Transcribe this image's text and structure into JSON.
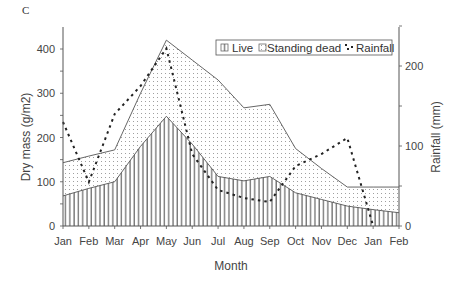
{
  "panel_label": "C",
  "chart_data": {
    "type": "area",
    "title": "",
    "xlabel": "Month",
    "ylabel": "Dry mass (g/m2)",
    "y2label": "Rainfall (mm)",
    "categories": [
      "Jan",
      "Feb",
      "Mar",
      "Apr",
      "May",
      "Jun",
      "Jul",
      "Aug",
      "Sep",
      "Oct",
      "Nov",
      "Dec",
      "Jan",
      "Feb"
    ],
    "ylim": [
      0,
      450
    ],
    "y2lim": [
      0,
      250
    ],
    "yticks": [
      0,
      100,
      200,
      300,
      400
    ],
    "y2ticks": [
      0,
      100,
      200
    ],
    "grid": false,
    "legend_position": "top-right",
    "series": [
      {
        "name": "Live",
        "type": "area",
        "pattern": "vertical-lines",
        "axis": "left",
        "values": [
          68,
          85,
          100,
          180,
          248,
          185,
          112,
          102,
          112,
          75,
          60,
          45,
          37,
          30
        ]
      },
      {
        "name": "Standing dead",
        "type": "area",
        "pattern": "dots",
        "axis": "left",
        "note": "values are total (Live + Standing dead) top boundary",
        "values": [
          143,
          158,
          172,
          300,
          420,
          375,
          330,
          267,
          275,
          175,
          130,
          88,
          88,
          88
        ]
      },
      {
        "name": "Rainfall",
        "type": "line",
        "style": "dashed",
        "axis": "right",
        "values": [
          130,
          55,
          140,
          175,
          222,
          90,
          45,
          35,
          30,
          75,
          90,
          110,
          0,
          null
        ]
      }
    ]
  },
  "legend": {
    "live": "Live",
    "dead": "Standing dead",
    "rain": "Rainfall"
  }
}
